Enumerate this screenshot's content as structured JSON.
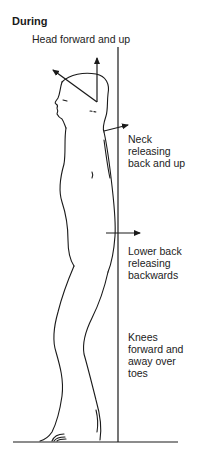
{
  "figure": {
    "title": "During",
    "labels": {
      "head": "Head forward and up",
      "neck": [
        "Neck",
        "releasing",
        "back and up"
      ],
      "lower_back": [
        "Lower back",
        "releasing",
        "backwards"
      ],
      "knees": [
        "Knees",
        "forward and",
        "away over",
        "toes"
      ]
    },
    "colors": {
      "line": "#1a1a1a",
      "background": "#ffffff"
    }
  }
}
